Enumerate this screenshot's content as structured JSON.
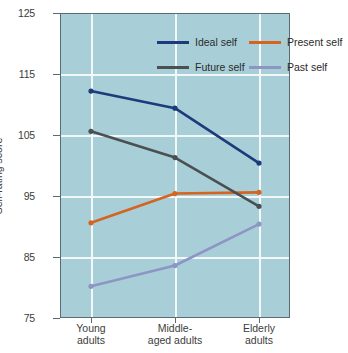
{
  "chart_data": {
    "type": "line",
    "title": "",
    "xlabel": "",
    "ylabel": "Self-rating score",
    "ylim": [
      75,
      125
    ],
    "yticks": [
      125,
      115,
      105,
      95,
      85,
      75
    ],
    "grid": true,
    "legend_position": "top-inside",
    "categories": [
      "Young adults",
      "Middle-aged adults",
      "Elderly adults"
    ],
    "category_lines": [
      [
        "Young",
        "adults"
      ],
      [
        "Middle-",
        "aged adults"
      ],
      [
        "Elderly",
        "adults"
      ]
    ],
    "series": [
      {
        "name": "Ideal self",
        "color": "#1d3b7a",
        "values": [
          112.2,
          109.4,
          100.4
        ]
      },
      {
        "name": "Present self",
        "color": "#d4641e",
        "values": [
          90.6,
          95.4,
          95.6
        ]
      },
      {
        "name": "Future self",
        "color": "#4a4f52",
        "values": [
          105.6,
          101.3,
          93.3
        ]
      },
      {
        "name": "Past self",
        "color": "#8e95c4",
        "values": [
          80.2,
          83.6,
          90.4
        ]
      }
    ]
  },
  "legend": {
    "entries": [
      {
        "label": "Ideal self"
      },
      {
        "label": "Present self"
      },
      {
        "label": "Future self"
      },
      {
        "label": "Past self"
      }
    ]
  },
  "colors": {
    "plot_background": "#a8cfd8",
    "gridline": "#f2f7f8",
    "axis": "#5b6b72",
    "text": "#3c3c3c"
  }
}
